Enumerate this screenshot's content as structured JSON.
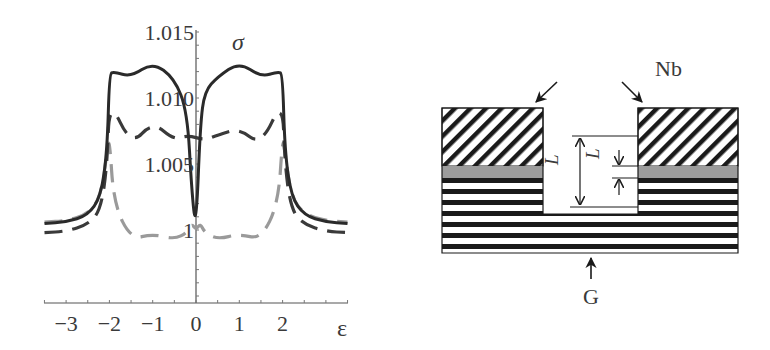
{
  "chart_data": {
    "type": "line",
    "title": "",
    "xlabel": "ε",
    "ylabel": "σ",
    "xlim": [
      -3.5,
      3.5
    ],
    "ylim": [
      0.9945,
      1.0155
    ],
    "x_ticks": [
      "-3",
      "-2",
      "-1",
      "0",
      "1",
      "2"
    ],
    "y_ticks": [
      "1",
      "1.005",
      "1.010",
      "1.015"
    ],
    "grid": false,
    "legend": null,
    "series": [
      {
        "name": "solid-dark",
        "style": "solid",
        "color": "#2a2a2a",
        "x": [
          -3.5,
          -3.0,
          -2.5,
          -2.2,
          -2.05,
          -2.0,
          -1.9,
          -1.5,
          -1.0,
          -0.5,
          -0.2,
          -0.1,
          0.0,
          0.1,
          0.2,
          0.5,
          1.0,
          1.5,
          1.9,
          2.0,
          2.05,
          2.2,
          2.5,
          3.0,
          3.5
        ],
        "values": [
          1.0005,
          1.0006,
          1.0011,
          1.0025,
          1.006,
          1.0118,
          1.012,
          1.0116,
          1.0127,
          1.0115,
          1.009,
          1.003,
          1.0,
          1.008,
          1.0105,
          1.0116,
          1.0127,
          1.0116,
          1.012,
          1.0118,
          1.006,
          1.0025,
          1.0011,
          1.0006,
          1.0005
        ]
      },
      {
        "name": "dashed-dark",
        "style": "dashed",
        "color": "#3a3a3a",
        "x": [
          -3.5,
          -3.0,
          -2.5,
          -2.2,
          -2.05,
          -2.0,
          -1.5,
          -1.0,
          -0.5,
          -0.2,
          0.2,
          0.5,
          1.0,
          1.5,
          2.0,
          2.05,
          2.2,
          2.5,
          3.0,
          3.5
        ],
        "values": [
          0.9998,
          0.9999,
          1.0004,
          1.0015,
          1.005,
          1.0099,
          1.0064,
          1.0082,
          1.0068,
          1.0072,
          1.0068,
          1.0072,
          1.0077,
          1.0064,
          1.0099,
          1.005,
          1.0015,
          1.0004,
          0.9999,
          0.9998
        ]
      },
      {
        "name": "dashed-light",
        "style": "dashed",
        "color": "#9a9a9a",
        "x": [
          -3.5,
          -3.0,
          -2.5,
          -2.2,
          -2.05,
          -2.0,
          -1.9,
          -1.5,
          -1.0,
          -0.5,
          -0.2,
          -0.1,
          0.0,
          0.1,
          0.2,
          0.5,
          1.0,
          1.5,
          1.9,
          2.0,
          2.05,
          2.2,
          2.5,
          3.0,
          3.5
        ],
        "values": [
          1.0006,
          1.0007,
          1.0012,
          1.0025,
          1.006,
          1.007,
          1.002,
          0.9993,
          0.9997,
          0.9993,
          0.9998,
          1.0005,
          1.0,
          1.0005,
          0.9998,
          0.9993,
          0.9997,
          0.9993,
          1.002,
          1.007,
          1.006,
          1.0025,
          1.0012,
          1.0007,
          1.0006
        ]
      }
    ]
  },
  "diagram": {
    "labels": {
      "top_material": "Nb",
      "bottom_material": "G",
      "dimension_outer": "L",
      "dimension_inner": "L"
    },
    "colors": {
      "line": "#1a1a1a",
      "gray_band": "#9c9c9c",
      "background": "#ffffff"
    }
  }
}
